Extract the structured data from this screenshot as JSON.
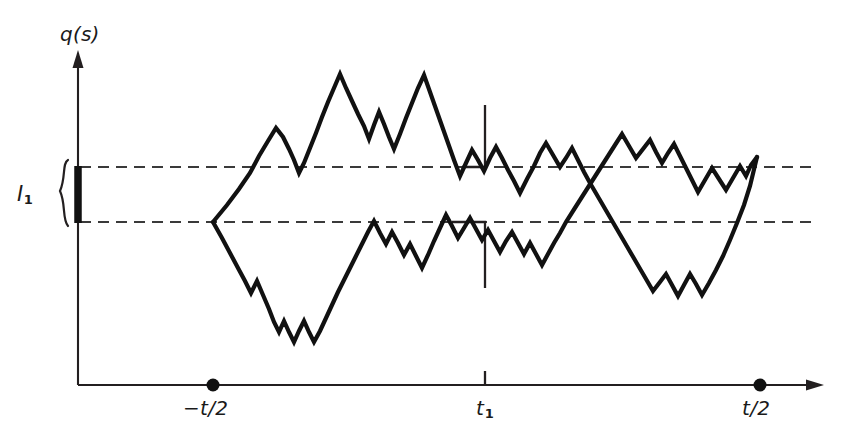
{
  "figure": {
    "kind": "line",
    "background_color": "#ffffff",
    "ink_color": "#111111",
    "width": 865,
    "height": 440
  },
  "labels": {
    "y_axis": "q(s)",
    "interval_main": "I",
    "interval_sub": "1",
    "tick_left": "−t/2",
    "tick_mid_main": "t",
    "tick_mid_sub": "1",
    "tick_right": "t/2"
  },
  "chart_data": {
    "type": "line",
    "title": "",
    "xlabel": "",
    "ylabel": "q(s)",
    "grid": false,
    "legend_position": "none",
    "xlim": [
      78,
      820
    ],
    "ylim": [
      385,
      55
    ],
    "axes": {
      "origin_x": 78,
      "origin_y": 385,
      "y_axis_top": 55,
      "x_axis_right": 820,
      "y_axis_label_text": "q(s)",
      "arrow_heads": [
        "up",
        "right"
      ]
    },
    "tick_labels": [
      {
        "id": "t-left",
        "text": "−t/2",
        "x": 213,
        "marker": "dot",
        "marker_radius": 6.5
      },
      {
        "id": "t-one",
        "text": "t₁",
        "x": 485,
        "marker": "tick",
        "tick_length": 14
      },
      {
        "id": "t-right",
        "text": "t/2",
        "x": 760,
        "marker": "dot",
        "marker_radius": 6.5
      }
    ],
    "guides": [
      {
        "id": "upper-level",
        "type": "hline",
        "y": 167,
        "x_start": 78,
        "x_end": 820,
        "style": "dashed"
      },
      {
        "id": "lower-level",
        "type": "hline",
        "y": 222,
        "x_start": 78,
        "x_end": 820,
        "style": "dashed"
      }
    ],
    "interval_marker": {
      "id": "I1",
      "label": "I₁",
      "x": 78,
      "y_top": 167,
      "y_bottom": 222,
      "brace_side": "left"
    },
    "bracket_at_t1": {
      "x": 485,
      "upper_vertical": [
        105,
        167
      ],
      "upper_stub_x": 462,
      "lower_vertical": [
        222,
        288
      ],
      "lower_stub_x": 452
    },
    "branch_point": {
      "x": 213,
      "y": 222
    },
    "meeting_point": {
      "x": 757,
      "y": 157
    },
    "series": [
      {
        "name": "upper-path",
        "points": [
          [
            213,
            222
          ],
          [
            227,
            205
          ],
          [
            239,
            189
          ],
          [
            250,
            173
          ],
          [
            259,
            156
          ],
          [
            268,
            141
          ],
          [
            276,
            128
          ],
          [
            283,
            137
          ],
          [
            289,
            149
          ],
          [
            294,
            160
          ],
          [
            299,
            173
          ],
          [
            304,
            163
          ],
          [
            310,
            148
          ],
          [
            316,
            133
          ],
          [
            322,
            117
          ],
          [
            328,
            102
          ],
          [
            334,
            88
          ],
          [
            340,
            74
          ],
          [
            346,
            88
          ],
          [
            352,
            101
          ],
          [
            358,
            114
          ],
          [
            364,
            126
          ],
          [
            369,
            139
          ],
          [
            374,
            125
          ],
          [
            379,
            112
          ],
          [
            384,
            124
          ],
          [
            389,
            137
          ],
          [
            394,
            149
          ],
          [
            400,
            134
          ],
          [
            406,
            118
          ],
          [
            412,
            103
          ],
          [
            418,
            88
          ],
          [
            424,
            75
          ],
          [
            430,
            92
          ],
          [
            436,
            109
          ],
          [
            442,
            126
          ],
          [
            448,
            143
          ],
          [
            454,
            160
          ],
          [
            460,
            176
          ],
          [
            466,
            163
          ],
          [
            472,
            150
          ],
          [
            478,
            160
          ],
          [
            484,
            171
          ],
          [
            490,
            158
          ],
          [
            496,
            147
          ],
          [
            502,
            158
          ],
          [
            508,
            170
          ],
          [
            514,
            181
          ],
          [
            520,
            193
          ],
          [
            527,
            179
          ],
          [
            534,
            166
          ],
          [
            540,
            153
          ],
          [
            546,
            143
          ],
          [
            553,
            155
          ],
          [
            560,
            167
          ],
          [
            566,
            158
          ],
          [
            572,
            148
          ],
          [
            578,
            160
          ],
          [
            584,
            172
          ],
          [
            590,
            183
          ],
          [
            597,
            195
          ],
          [
            604,
            207
          ],
          [
            611,
            219
          ],
          [
            618,
            231
          ],
          [
            625,
            243
          ],
          [
            632,
            255
          ],
          [
            639,
            267
          ],
          [
            646,
            279
          ],
          [
            653,
            291
          ],
          [
            660,
            282
          ],
          [
            666,
            274
          ],
          [
            672,
            285
          ],
          [
            678,
            296
          ],
          [
            684,
            285
          ],
          [
            690,
            274
          ],
          [
            696,
            284
          ],
          [
            702,
            295
          ],
          [
            709,
            283
          ],
          [
            716,
            270
          ],
          [
            723,
            256
          ],
          [
            730,
            240
          ],
          [
            737,
            223
          ],
          [
            744,
            205
          ],
          [
            750,
            186
          ],
          [
            757,
            157
          ]
        ]
      },
      {
        "name": "lower-path",
        "points": [
          [
            213,
            222
          ],
          [
            222,
            238
          ],
          [
            230,
            253
          ],
          [
            238,
            268
          ],
          [
            245,
            281
          ],
          [
            251,
            293
          ],
          [
            257,
            281
          ],
          [
            263,
            295
          ],
          [
            269,
            309
          ],
          [
            274,
            322
          ],
          [
            279,
            332
          ],
          [
            284,
            321
          ],
          [
            289,
            332
          ],
          [
            294,
            342
          ],
          [
            299,
            331
          ],
          [
            304,
            321
          ],
          [
            309,
            332
          ],
          [
            314,
            342
          ],
          [
            320,
            331
          ],
          [
            326,
            318
          ],
          [
            332,
            305
          ],
          [
            338,
            292
          ],
          [
            344,
            280
          ],
          [
            350,
            268
          ],
          [
            356,
            256
          ],
          [
            362,
            244
          ],
          [
            368,
            232
          ],
          [
            374,
            221
          ],
          [
            380,
            233
          ],
          [
            386,
            244
          ],
          [
            392,
            232
          ],
          [
            398,
            243
          ],
          [
            404,
            255
          ],
          [
            410,
            244
          ],
          [
            416,
            256
          ],
          [
            422,
            268
          ],
          [
            428,
            255
          ],
          [
            434,
            241
          ],
          [
            440,
            228
          ],
          [
            446,
            215
          ],
          [
            452,
            226
          ],
          [
            458,
            238
          ],
          [
            464,
            228
          ],
          [
            470,
            218
          ],
          [
            476,
            229
          ],
          [
            482,
            240
          ],
          [
            488,
            230
          ],
          [
            494,
            241
          ],
          [
            500,
            252
          ],
          [
            506,
            241
          ],
          [
            512,
            232
          ],
          [
            518,
            243
          ],
          [
            524,
            254
          ],
          [
            530,
            243
          ],
          [
            536,
            254
          ],
          [
            542,
            265
          ],
          [
            548,
            254
          ],
          [
            554,
            243
          ],
          [
            560,
            233
          ],
          [
            566,
            222
          ],
          [
            573,
            211
          ],
          [
            580,
            200
          ],
          [
            587,
            189
          ],
          [
            594,
            178
          ],
          [
            601,
            167
          ],
          [
            608,
            156
          ],
          [
            615,
            145
          ],
          [
            622,
            134
          ],
          [
            629,
            146
          ],
          [
            636,
            158
          ],
          [
            643,
            149
          ],
          [
            650,
            140
          ],
          [
            656,
            152
          ],
          [
            662,
            163
          ],
          [
            668,
            153
          ],
          [
            674,
            144
          ],
          [
            680,
            156
          ],
          [
            686,
            168
          ],
          [
            692,
            180
          ],
          [
            698,
            192
          ],
          [
            705,
            180
          ],
          [
            712,
            168
          ],
          [
            719,
            179
          ],
          [
            726,
            190
          ],
          [
            733,
            178
          ],
          [
            740,
            166
          ],
          [
            746,
            176
          ],
          [
            751,
            165
          ],
          [
            757,
            157
          ]
        ]
      }
    ]
  }
}
